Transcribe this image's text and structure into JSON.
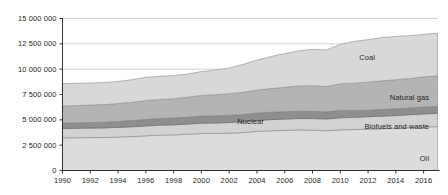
{
  "chart_data": {
    "type": "area",
    "title": "",
    "subtitle": "",
    "xlabel": "",
    "ylabel": "",
    "stacked": true,
    "grid": true,
    "legend_position": "inline-right",
    "xlim": [
      1990,
      2017
    ],
    "ylim": [
      0,
      15000000
    ],
    "x": [
      1990,
      1991,
      1992,
      1993,
      1994,
      1995,
      1996,
      1997,
      1998,
      1999,
      2000,
      2001,
      2002,
      2003,
      2004,
      2005,
      2006,
      2007,
      2008,
      2009,
      2010,
      2011,
      2012,
      2013,
      2014,
      2015,
      2016,
      2017
    ],
    "ytick_labels": [
      "0",
      "2 500 000",
      "5 000 000",
      "7 500 000",
      "10 000 000",
      "12 500 000",
      "15 000 000"
    ],
    "ytick_values": [
      0,
      2500000,
      5000000,
      7500000,
      10000000,
      12500000,
      15000000
    ],
    "xtick_labels": [
      "1990",
      "1992",
      "1994",
      "1996",
      "1998",
      "2000",
      "2002",
      "2004",
      "2006",
      "2008",
      "2010",
      "2012",
      "2014",
      "2016"
    ],
    "xtick_values": [
      1990,
      1992,
      1994,
      1996,
      1998,
      2000,
      2002,
      2004,
      2006,
      2008,
      2010,
      2012,
      2014,
      2016
    ],
    "series": [
      {
        "name": "Oil",
        "label": "Oil",
        "color": "#dcdcdc",
        "stroke": "#9a9a9a",
        "label_x": 2016.4,
        "label_y": 1150000,
        "values": [
          3225000,
          3230000,
          3250000,
          3255000,
          3300000,
          3350000,
          3420000,
          3490000,
          3510000,
          3580000,
          3650000,
          3660000,
          3690000,
          3740000,
          3860000,
          3920000,
          3960000,
          4000000,
          3980000,
          3920000,
          4010000,
          4040000,
          4080000,
          4120000,
          4160000,
          4230000,
          4290000,
          4330000
        ]
      },
      {
        "name": "Biofuels and waste",
        "label": "Biofuels and waste",
        "color": "#d2d2d2",
        "stroke": "#8f8f8f",
        "label_x": 2016.4,
        "label_y": 4280000,
        "values": [
          925000,
          930000,
          935000,
          945000,
          955000,
          965000,
          975000,
          985000,
          995000,
          1005000,
          1020000,
          1030000,
          1045000,
          1060000,
          1080000,
          1100000,
          1115000,
          1130000,
          1150000,
          1165000,
          1190000,
          1205000,
          1225000,
          1245000,
          1265000,
          1280000,
          1295000,
          1310000
        ]
      },
      {
        "name": "Nuclear",
        "label": "Nuclear",
        "color": "#8e8e8e",
        "stroke": "#6e6e6e",
        "label_x": 2004.5,
        "label_y": 4760000,
        "values": [
          525000,
          545000,
          555000,
          565000,
          590000,
          615000,
          640000,
          645000,
          665000,
          685000,
          700000,
          710000,
          720000,
          715000,
          730000,
          735000,
          735000,
          720000,
          715000,
          705000,
          720000,
          675000,
          645000,
          650000,
          665000,
          670000,
          680000,
          690000
        ]
      },
      {
        "name": "Natural gas",
        "label": "Natural gas",
        "color": "#b4b4b4",
        "stroke": "#8a8a8a",
        "label_x": 2016.4,
        "label_y": 7180000,
        "values": [
          1680000,
          1700000,
          1715000,
          1740000,
          1760000,
          1800000,
          1870000,
          1880000,
          1920000,
          1965000,
          2040000,
          2065000,
          2130000,
          2195000,
          2265000,
          2330000,
          2395000,
          2490000,
          2530000,
          2490000,
          2640000,
          2700000,
          2770000,
          2830000,
          2865000,
          2900000,
          2980000,
          3020000
        ]
      },
      {
        "name": "Coal",
        "label": "Coal",
        "color": "#d8d8d8",
        "stroke": "#9a9a9a",
        "label_x": 2012.5,
        "label_y": 11150000,
        "values": [
          2220000,
          2200000,
          2170000,
          2180000,
          2175000,
          2230000,
          2290000,
          2300000,
          2280000,
          2280000,
          2350000,
          2430000,
          2530000,
          2760000,
          2960000,
          3160000,
          3330000,
          3470000,
          3580000,
          3610000,
          3880000,
          4120000,
          4190000,
          4270000,
          4280000,
          4230000,
          4180000,
          4200000
        ]
      }
    ]
  },
  "axis": {
    "tick_color": "#231f20",
    "grid_color": "#c8c8c8",
    "axis_color": "#231f20"
  }
}
